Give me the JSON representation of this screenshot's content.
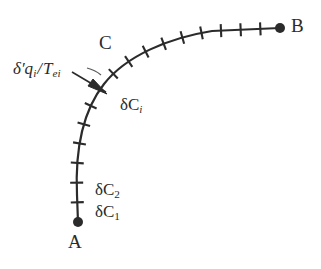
{
  "figure": {
    "type": "thermodynamic-path-diagram",
    "background_color": "#ffffff",
    "ink_color": "#2b2b2b",
    "width": 321,
    "height": 269
  },
  "labels": {
    "point_a": "A",
    "point_b": "B",
    "curve": "C",
    "segment_i": "δC",
    "segment_i_sub": "i",
    "segment_2": "δC",
    "segment_2_sub": "2",
    "segment_1": "δC",
    "segment_1_sub": "1",
    "heat_flux_numerator": "δ′q",
    "heat_flux_numerator_sub": "i",
    "heat_flux_slash": "/",
    "heat_flux_denominator": "T",
    "heat_flux_denominator_sub": "ei"
  },
  "geometry": {
    "endpoint_a": {
      "x": 78,
      "y": 222,
      "marker": "filled-dot",
      "radius": 5
    },
    "endpoint_b": {
      "x": 280,
      "y": 28,
      "marker": "filled-dot",
      "radius": 5
    },
    "curve_path": "M 78 222 L 77 195 C 75 150 82 112 104 84 C 126 56 168 38 212 31 L 280 28",
    "stroke_width": 2.2,
    "tick_count": 17,
    "tick_half_length": 6.5,
    "arrow": {
      "from_x": 74,
      "from_y": 73,
      "to_x": 105,
      "to_y": 92,
      "head": "solid-triangle"
    },
    "leader_from_label": {
      "x": 86,
      "y": 67,
      "to_x": 99,
      "to_y": 73
    }
  }
}
